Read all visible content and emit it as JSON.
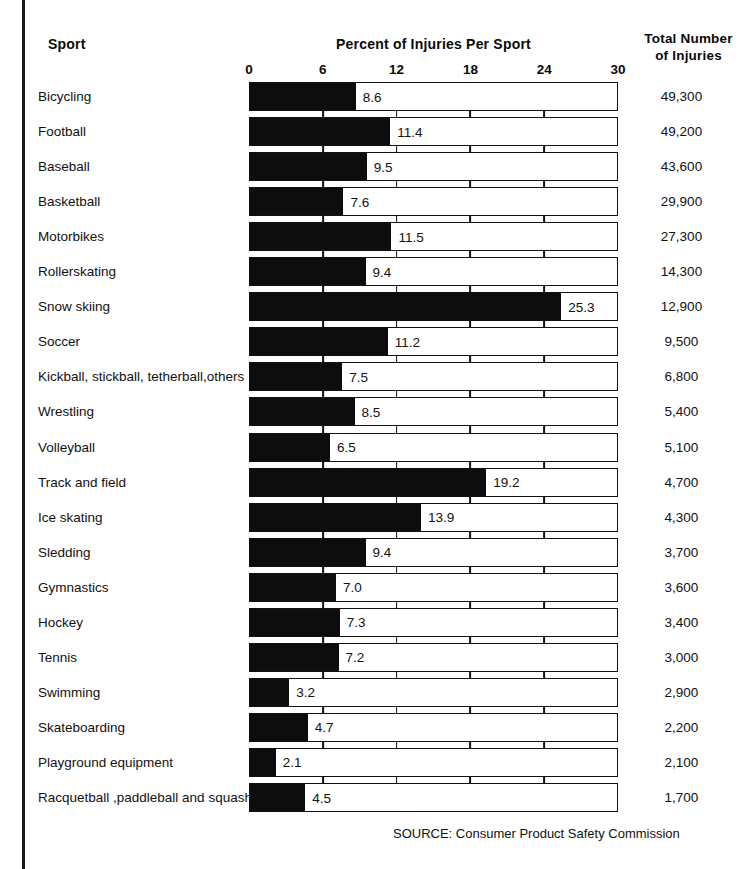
{
  "header": {
    "sport_label": "Sport",
    "percent_label": "Percent of Injuries Per Sport",
    "total_label_line1": "Total Number",
    "total_label_line2": "of Injuries"
  },
  "source": "SOURCE: Consumer Product Safety Commission",
  "colors": {
    "bar_fill": "#0d0d0d",
    "bar_outline": "#111111",
    "background": "#ffffff",
    "text": "#111111"
  },
  "chart_data": {
    "type": "bar",
    "orientation": "horizontal",
    "title": "Percent of Injuries Per Sport",
    "xlabel": "Percent of Injuries Per Sport",
    "ylabel": "Sport",
    "xlim": [
      0,
      30
    ],
    "xticks": [
      0,
      6,
      12,
      18,
      24,
      30
    ],
    "xtick_labels": [
      "0",
      "6",
      "12",
      "18",
      "24",
      "30"
    ],
    "grid": false,
    "legend": "none",
    "categories": [
      "Bicycling",
      "Football",
      "Baseball",
      "Basketball",
      "Motorbikes",
      "Rollerskating",
      "Snow skiing",
      "Soccer",
      "Kickball, stickball, tetherball,others",
      "Wrestling",
      "Volleyball",
      "Track and field",
      "Ice skating",
      "Sledding",
      "Gymnastics",
      "Hockey",
      "Tennis",
      "Swimming",
      "Skateboarding",
      "Playground equipment",
      "Racquetball ,paddleball and squash"
    ],
    "values": [
      8.6,
      11.4,
      9.5,
      7.6,
      11.5,
      9.4,
      25.3,
      11.2,
      7.5,
      8.5,
      6.5,
      19.2,
      13.9,
      9.4,
      7.0,
      7.3,
      7.2,
      3.2,
      4.7,
      2.1,
      4.5
    ],
    "value_labels": [
      "8.6",
      "11.4",
      "9.5",
      "7.6",
      "11.5",
      "9.4",
      "25.3",
      "11.2",
      "7.5",
      "8.5",
      "6.5",
      "19.2",
      "13.9",
      "9.4",
      "7.0",
      "7.3",
      "7.2",
      "3.2",
      "4.7",
      "2.1",
      "4.5"
    ],
    "secondary_series": {
      "name": "Total Number of Injuries",
      "labels": [
        "49,300",
        "49,200",
        "43,600",
        "29,900",
        "27,300",
        "14,300",
        "12,900",
        "9,500",
        "6,800",
        "5,400",
        "5,100",
        "4,700",
        "4,300",
        "3,700",
        "3,600",
        "3,400",
        "3,000",
        "2,900",
        "2,200",
        "2,100",
        "1,700"
      ],
      "values": [
        49300,
        49200,
        43600,
        29900,
        27300,
        14300,
        12900,
        9500,
        6800,
        5400,
        5100,
        4700,
        4300,
        3700,
        3600,
        3400,
        3000,
        2900,
        2200,
        2100,
        1700
      ]
    }
  }
}
